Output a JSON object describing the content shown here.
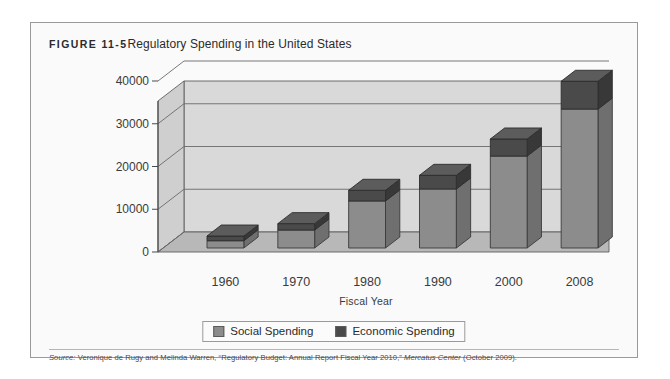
{
  "figure": {
    "number_label": "FIGURE 11-5",
    "title": "Regulatory Spending in the United States"
  },
  "source": {
    "label": "Source:",
    "text_part1": " Veronique de Rugy and Melinda Warren, “Regulatory Budget: Annual Report Fiscal Year 2010,” ",
    "italic_publication": "Mercatus Center",
    "text_part2": " (October 2009)."
  },
  "legend": {
    "items": [
      {
        "label": "Social Spending",
        "color": "#8c8c8c"
      },
      {
        "label": "Economic Spending",
        "color": "#4a4a4a"
      }
    ]
  },
  "colors": {
    "social_front": "#8c8c8c",
    "social_side": "#6f6f6f",
    "social_top": "#9f9f9f",
    "economic_front": "#4a4a4a",
    "economic_side": "#383838",
    "economic_top": "#5c5c5c",
    "wall_back": "#d9d9d9",
    "wall_left": "#cfcfcf",
    "floor": "#b8b8b8",
    "gridline": "#6a6a6a",
    "frame": "#9a9a9a"
  },
  "chart_data": {
    "type": "bar",
    "title": "Regulatory Spending in the United States",
    "subtitle": "",
    "xlabel": "Fiscal Year",
    "ylabel": "",
    "stacked": true,
    "three_d": true,
    "grid": true,
    "legend_position": "bottom",
    "categories": [
      "1960",
      "1970",
      "1980",
      "1990",
      "2000",
      "2008"
    ],
    "yticks": [
      0,
      10000,
      20000,
      30000,
      40000
    ],
    "ylim": [
      0,
      40000
    ],
    "series": [
      {
        "name": "Social Spending",
        "values": [
          1700,
          4200,
          11000,
          13800,
          21500,
          32500
        ]
      },
      {
        "name": "Economic Spending",
        "values": [
          1100,
          1500,
          2500,
          3200,
          4000,
          6500
        ]
      }
    ],
    "totals": [
      2800,
      5700,
      13500,
      17000,
      25500,
      39000
    ]
  }
}
